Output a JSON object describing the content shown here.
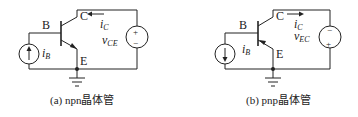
{
  "figures": [
    {
      "id": "a",
      "caption": "(a) npn晶体管",
      "labels": {
        "base": "B",
        "collector": "C",
        "emitter": "E",
        "current_source": "i",
        "current_source_sub": "B",
        "collector_current": "i",
        "collector_current_sub": "C",
        "voltage": "v",
        "voltage_sub": "CE",
        "plus": "+",
        "minus": "−"
      }
    },
    {
      "id": "b",
      "caption": "(b) pnp晶体管",
      "labels": {
        "base": "B",
        "collector": "C",
        "emitter": "E",
        "current_source": "i",
        "current_source_sub": "B",
        "collector_current": "i",
        "collector_current_sub": "C",
        "voltage": "v",
        "voltage_sub": "EC",
        "plus": "+",
        "minus": "−"
      }
    }
  ]
}
